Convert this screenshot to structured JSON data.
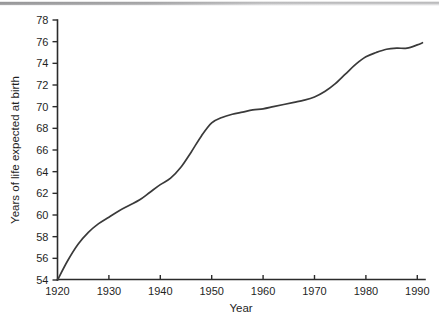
{
  "figure": {
    "background_color": "#ffffff",
    "line_color": "#3a3a3a",
    "axis_color": "#2b2b2b",
    "scan_artifact": "gray-band-top"
  },
  "chart_data": {
    "type": "line",
    "title": "",
    "xlabel": "Year",
    "ylabel": "Years of life expected at birth",
    "xlim": [
      1920,
      1991.5
    ],
    "ylim": [
      54,
      78
    ],
    "xticks": [
      1920,
      1930,
      1940,
      1950,
      1960,
      1970,
      1980,
      1990
    ],
    "xtick_labels": [
      "1920",
      "1930",
      "1940",
      "1950",
      "1960",
      "1970",
      "1980",
      "1990"
    ],
    "yticks": [
      54,
      56,
      58,
      60,
      62,
      64,
      66,
      68,
      70,
      72,
      74,
      76,
      78
    ],
    "ytick_labels": [
      "54",
      "56",
      "58",
      "60",
      "62",
      "64",
      "66",
      "68",
      "70",
      "72",
      "74",
      "76",
      "78"
    ],
    "grid": false,
    "legend": null,
    "series": [
      {
        "name": "Years of life expected at birth",
        "x": [
          1920,
          1922,
          1924,
          1926,
          1928,
          1930,
          1932,
          1934,
          1936,
          1938,
          1940,
          1942,
          1944,
          1946,
          1948,
          1950,
          1952,
          1954,
          1956,
          1958,
          1960,
          1962,
          1964,
          1966,
          1968,
          1970,
          1972,
          1974,
          1976,
          1978,
          1980,
          1982,
          1984,
          1986,
          1988,
          1990,
          1991
        ],
        "y": [
          54.0,
          55.8,
          57.3,
          58.4,
          59.2,
          59.8,
          60.4,
          60.9,
          61.4,
          62.1,
          62.8,
          63.4,
          64.4,
          65.8,
          67.3,
          68.5,
          69.0,
          69.3,
          69.5,
          69.7,
          69.8,
          70.0,
          70.2,
          70.4,
          70.6,
          70.9,
          71.4,
          72.1,
          73.0,
          73.9,
          74.6,
          75.0,
          75.3,
          75.4,
          75.4,
          75.7,
          75.9
        ]
      }
    ]
  }
}
